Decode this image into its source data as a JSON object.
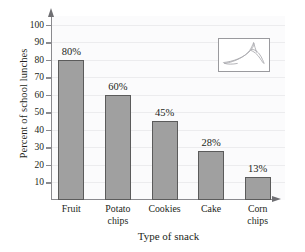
{
  "chart_data": {
    "type": "bar",
    "title": "",
    "categories": [
      "Fruit",
      "Potato chips",
      "Cookies",
      "Cake",
      "Corn chips"
    ],
    "category_lines": [
      [
        "Fruit"
      ],
      [
        "Potato",
        "chips"
      ],
      [
        "Cookies"
      ],
      [
        "Cake"
      ],
      [
        "Corn",
        "chips"
      ]
    ],
    "values": [
      80,
      60,
      45,
      28,
      13
    ],
    "data_labels": [
      "80%",
      "60%",
      "45%",
      "28%",
      "13%"
    ],
    "xlabel": "Type of snack",
    "ylabel": "Percent of school lunches",
    "ylim": [
      0,
      105
    ],
    "ytick_values": [
      10,
      20,
      30,
      40,
      50,
      60,
      70,
      80,
      90,
      100
    ],
    "ytick_labels": [
      "10",
      "20",
      "30",
      "40",
      "50",
      "60",
      "70",
      "80",
      "90",
      "100"
    ],
    "grid": true,
    "grid_axis": "y",
    "legend": false,
    "bar_color": "#a0a0a0",
    "bar_edge_color": "#5b5b5b",
    "axis_color": "#8a8a8e",
    "text_color": "#231f20",
    "plot_background": "#fbfbfc"
  },
  "inset": {
    "name": "banana-line-drawing",
    "border_color": "#9a9a9e",
    "stroke_color": "#a9a9ad"
  }
}
